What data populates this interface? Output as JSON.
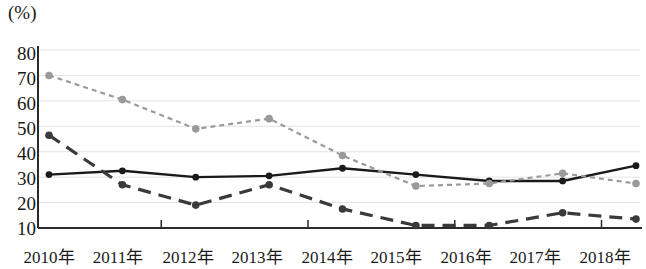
{
  "chart_data": {
    "type": "line",
    "title": "",
    "subtitle": "",
    "xlabel": "",
    "ylabel": "(%)",
    "unit_label": "(%)",
    "categories": [
      "2010年",
      "2011年",
      "2012年",
      "2013年",
      "2014年",
      "2015年",
      "2016年",
      "2017年",
      "2018年"
    ],
    "x": [
      2010,
      2011,
      2012,
      2013,
      2014,
      2015,
      2016,
      2017,
      2018
    ],
    "ylim": [
      10,
      80
    ],
    "yticks": [
      10,
      20,
      30,
      40,
      50,
      60,
      70,
      80
    ],
    "ytick_labels": [
      "10",
      "20",
      "30",
      "40",
      "50",
      "60",
      "70",
      "80"
    ],
    "grid": true,
    "grid_axis": "y",
    "legend": null,
    "legend_position": "none",
    "series": [
      {
        "name": "series-solid",
        "style": "solid",
        "color": "#1a1a1a",
        "marker": "circle",
        "values": [
          31,
          32.5,
          30,
          30.5,
          33.5,
          31,
          28.5,
          28.5,
          34.5
        ]
      },
      {
        "name": "series-dotted-gray",
        "style": "dotted",
        "color": "#9a9a9a",
        "marker": "circle",
        "values": [
          70,
          60.5,
          49,
          53,
          38.5,
          26.5,
          27.5,
          31.5,
          27.5
        ]
      },
      {
        "name": "series-dashed-dark",
        "style": "dashed",
        "color": "#3a3a3a",
        "marker": "circle",
        "values": [
          46.5,
          27,
          19,
          27,
          17.5,
          11,
          11,
          16,
          13.5
        ]
      }
    ]
  },
  "axis": {
    "unit": "(%)",
    "y_labels": [
      "80",
      "70",
      "60",
      "50",
      "40",
      "30",
      "20",
      "10"
    ],
    "x_labels": [
      "2010年",
      "2011年",
      "2012年",
      "2013年",
      "2014年",
      "2015年",
      "2016年",
      "2017年",
      "2018年"
    ]
  },
  "colors": {
    "solid_line": "#1a1a1a",
    "dotted_line": "#9a9a9a",
    "dashed_line": "#3a3a3a",
    "grid": "#e6e2e2",
    "axis": "#2b2b2b"
  }
}
